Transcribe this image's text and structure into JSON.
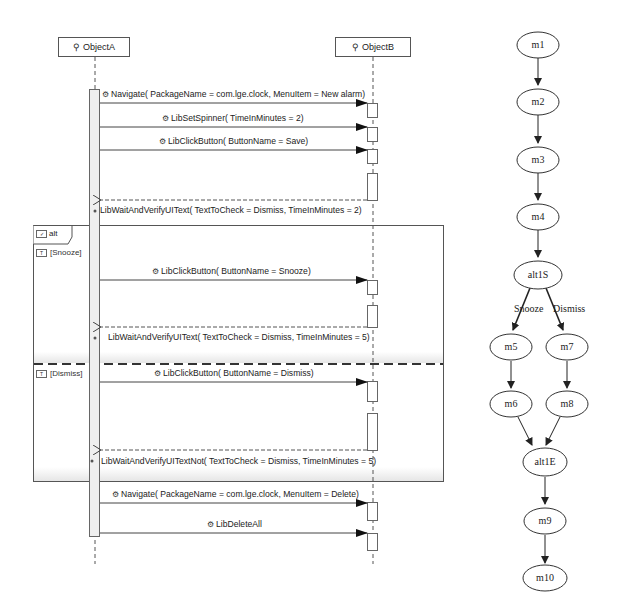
{
  "sequence_diagram": {
    "lifelines": [
      {
        "name": "ObjectA",
        "icon": "lifeline-icon"
      },
      {
        "name": "ObjectB",
        "icon": "lifeline-icon"
      }
    ],
    "messages_before": [
      {
        "label": "Navigate( PackageName = com.lge.clock,  MenuItem = New alarm)",
        "type": "sync"
      },
      {
        "label": "LibSetSpinner( TimeInMinutes = 2)",
        "type": "sync"
      },
      {
        "label": "LibClickButton( ButtonName = Save)",
        "type": "sync"
      },
      {
        "label": "LibWaitAndVerifyUIText( TextToCheck = Dismiss,  TimeInMinutes = 2)",
        "type": "return"
      }
    ],
    "alt_fragment": {
      "operator": "alt",
      "operands": [
        {
          "guard": "[Snooze]",
          "messages": [
            {
              "label": "LibClickButton( ButtonName = Snooze)",
              "type": "sync"
            },
            {
              "label": "LibWaitAndVerifyUIText( TextToCheck = Dismiss,  TimeInMinutes = 5)",
              "type": "return"
            }
          ]
        },
        {
          "guard": "[Dismiss]",
          "messages": [
            {
              "label": "LibClickButton( ButtonName = Dismiss)",
              "type": "sync"
            },
            {
              "label": "LibWaitAndVerifyUITextNot( TextToCheck = Dismiss,  TimeInMinutes = 5)",
              "type": "return"
            }
          ]
        }
      ]
    },
    "messages_after": [
      {
        "label": "Navigate( PackageName = com.lge.clock,  MenuItem = Delete)",
        "type": "sync"
      },
      {
        "label": "LibDeleteAll",
        "type": "sync"
      }
    ]
  },
  "flow_graph": {
    "nodes": [
      "m1",
      "m2",
      "m3",
      "m4",
      "alt1S",
      "m5",
      "m6",
      "m7",
      "m8",
      "alt1E",
      "m9",
      "m10"
    ],
    "edges": [
      {
        "from": "m1",
        "to": "m2"
      },
      {
        "from": "m2",
        "to": "m3"
      },
      {
        "from": "m3",
        "to": "m4"
      },
      {
        "from": "m4",
        "to": "alt1S"
      },
      {
        "from": "alt1S",
        "to": "m5",
        "label": "Snooze"
      },
      {
        "from": "alt1S",
        "to": "m7",
        "label": "Dismiss"
      },
      {
        "from": "m5",
        "to": "m6"
      },
      {
        "from": "m7",
        "to": "m8"
      },
      {
        "from": "m6",
        "to": "alt1E"
      },
      {
        "from": "m8",
        "to": "alt1E"
      },
      {
        "from": "alt1E",
        "to": "m9"
      },
      {
        "from": "m9",
        "to": "m10"
      }
    ],
    "edge_labels": {
      "snooze": "Snooze",
      "dismiss": "Dismiss"
    }
  }
}
